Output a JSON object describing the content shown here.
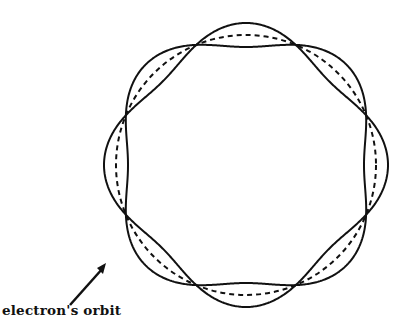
{
  "figure": {
    "label": "electron's orbit",
    "center": [
      246,
      165
    ],
    "orbit_radius": 130,
    "wave_amplitude": 12,
    "node_count": 8,
    "stroke_color": "#111111",
    "background": "#ffffff"
  }
}
